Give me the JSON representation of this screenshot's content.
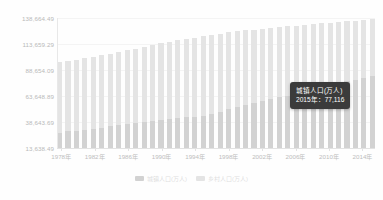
{
  "chart_data": {
    "type": "bar",
    "title": "",
    "subtitle": "",
    "xlabel": "",
    "ylabel": "",
    "stacked": true,
    "grid": true,
    "legend_position": "bottom",
    "ylim": [
      13638.49,
      138664.49
    ],
    "ytick_labels": [
      "138,664.49",
      "113,659.29",
      "88,654.09",
      "63,648.89",
      "38,643.69",
      "13,638.49"
    ],
    "ytick_values": [
      138664.49,
      113659.29,
      88654.09,
      63648.89,
      38643.69,
      13638.49
    ],
    "x": [
      1978,
      1979,
      1980,
      1981,
      1982,
      1983,
      1984,
      1985,
      1986,
      1987,
      1988,
      1989,
      1990,
      1991,
      1992,
      1993,
      1994,
      1995,
      1996,
      1997,
      1998,
      1999,
      2000,
      2001,
      2002,
      2003,
      2004,
      2005,
      2006,
      2007,
      2008,
      2009,
      2010,
      2011,
      2012,
      2013,
      2014,
      2015
    ],
    "categories": [
      "1978年",
      "1979年",
      "1980年",
      "1981年",
      "1982年",
      "1983年",
      "1984年",
      "1985年",
      "1986年",
      "1987年",
      "1988年",
      "1989年",
      "1990年",
      "1991年",
      "1992年",
      "1993年",
      "1994年",
      "1995年",
      "1996年",
      "1997年",
      "1998年",
      "1999年",
      "2000年",
      "2001年",
      "2002年",
      "2003年",
      "2004年",
      "2005年",
      "2006年",
      "2007年",
      "2008年",
      "2009年",
      "2010年",
      "2011年",
      "2012年",
      "2013年",
      "2014年",
      "2015年"
    ],
    "xtick_labels": [
      "1978年",
      "1982年",
      "1986年",
      "1990年",
      "1994年",
      "1998年",
      "2002年",
      "2006年",
      "2010年",
      "2014年"
    ],
    "xtick_indices": [
      0,
      4,
      8,
      12,
      16,
      20,
      24,
      28,
      32,
      36
    ],
    "series": [
      {
        "name": "城镇人口(万人)",
        "color": "#d2d2d2",
        "values": [
          17245,
          18495,
          19140,
          20171,
          21480,
          22274,
          24017,
          25094,
          26366,
          27674,
          28661,
          29540,
          30195,
          31203,
          32175,
          33173,
          34169,
          35174,
          37304,
          39449,
          41608,
          43748,
          45906,
          48064,
          50212,
          52376,
          54283,
          56212,
          58288,
          60633,
          62403,
          64512,
          66978,
          69079,
          71182,
          73111,
          74916,
          77116
        ]
      },
      {
        "name": "乡村人口(万人)",
        "color": "#e4e4e4",
        "values": [
          79014,
          79047,
          79565,
          79901,
          80174,
          80734,
          80340,
          80757,
          81141,
          81626,
          82365,
          83164,
          84138,
          84620,
          84996,
          85344,
          85681,
          85947,
          85085,
          84177,
          83153,
          82038,
          80837,
          79563,
          78241,
          76851,
          75705,
          74544,
          73160,
          71496,
          70399,
          68938,
          67113,
          65656,
          64222,
          62961,
          61866,
          60346
        ]
      }
    ],
    "tooltip": {
      "visible": true,
      "series_label": "城镇人口(万人)",
      "detail": "2015年：77,116",
      "year": "2015年",
      "value": "77,116",
      "background": "#3b3b3b",
      "text_color": "#ffffff"
    },
    "colors": {
      "urban": "#d2d2d2",
      "rural": "#e4e4e4",
      "gridline": "#f4f4f4",
      "axis": "#e2e2e2",
      "tick_text": "#bdbdbd",
      "legend_text": "#dedede",
      "background": "#fefefe"
    },
    "legend": [
      {
        "label": "城镇人口(万人)",
        "color": "#d2d2d2"
      },
      {
        "label": "乡村人口(万人)",
        "color": "#e4e4e4"
      }
    ]
  }
}
